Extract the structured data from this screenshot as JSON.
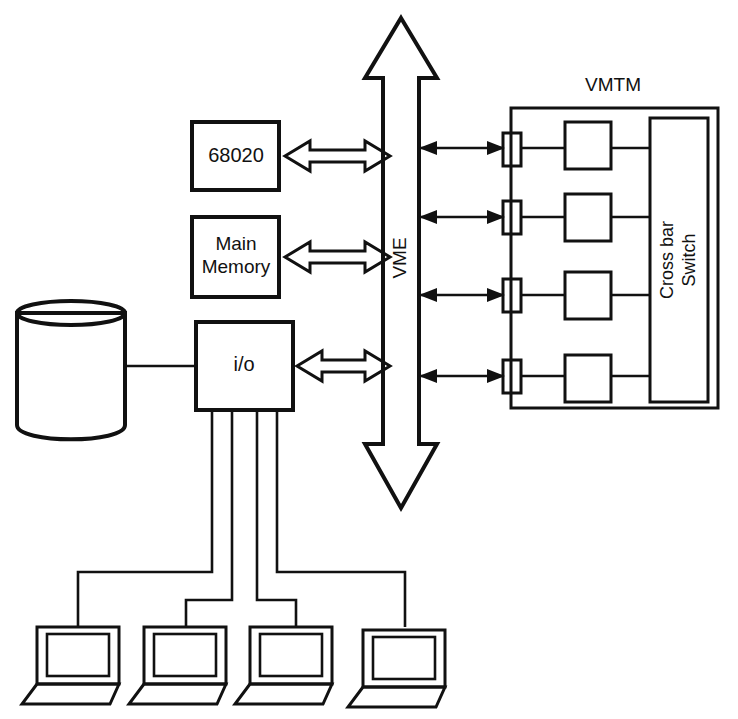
{
  "diagram": {
    "background_color": "#ffffff",
    "line_color": "#111111",
    "nodes": {
      "cpu": {
        "label": "68020",
        "shape": "rectangle"
      },
      "memory": {
        "label_line1": "Main",
        "label_line2": "Memory",
        "shape": "rectangle"
      },
      "io": {
        "label": "i/o",
        "shape": "rectangle"
      },
      "disk": {
        "label": "",
        "shape": "cylinder"
      },
      "bus": {
        "label": "VME",
        "shape": "double-headed-vertical-arrow",
        "orientation": "vertical"
      },
      "vmtm": {
        "label": "VMTM",
        "shape": "container-rectangle"
      },
      "crossbar": {
        "label_line1": "Cross bar",
        "label_line2": "Switch",
        "shape": "rectangle",
        "orientation": "vertical"
      }
    },
    "vmtm_ports": [
      {
        "name": "port-1"
      },
      {
        "name": "port-2"
      },
      {
        "name": "port-3"
      },
      {
        "name": "port-4"
      }
    ],
    "vmtm_modules": [
      {
        "name": "module-1",
        "label": ""
      },
      {
        "name": "module-2",
        "label": ""
      },
      {
        "name": "module-3",
        "label": ""
      },
      {
        "name": "module-4",
        "label": ""
      }
    ],
    "terminals": [
      {
        "name": "terminal-1",
        "label": ""
      },
      {
        "name": "terminal-2",
        "label": ""
      },
      {
        "name": "terminal-3",
        "label": ""
      },
      {
        "name": "terminal-4",
        "label": ""
      }
    ],
    "connections": [
      {
        "from": "cpu",
        "to": "bus",
        "style": "hollow-double-arrow"
      },
      {
        "from": "memory",
        "to": "bus",
        "style": "hollow-double-arrow"
      },
      {
        "from": "io",
        "to": "bus",
        "style": "hollow-double-arrow"
      },
      {
        "from": "disk",
        "to": "io",
        "style": "plain-line"
      },
      {
        "from": "bus",
        "to": "vmtm-port-1",
        "style": "thin-double-arrow"
      },
      {
        "from": "bus",
        "to": "vmtm-port-2",
        "style": "thin-double-arrow"
      },
      {
        "from": "bus",
        "to": "vmtm-port-3",
        "style": "thin-double-arrow"
      },
      {
        "from": "bus",
        "to": "vmtm-port-4",
        "style": "thin-double-arrow"
      },
      {
        "from": "io",
        "to": "terminal-1",
        "style": "plain-line"
      },
      {
        "from": "io",
        "to": "terminal-2",
        "style": "plain-line"
      },
      {
        "from": "io",
        "to": "terminal-3",
        "style": "plain-line"
      },
      {
        "from": "io",
        "to": "terminal-4",
        "style": "plain-line"
      }
    ]
  }
}
